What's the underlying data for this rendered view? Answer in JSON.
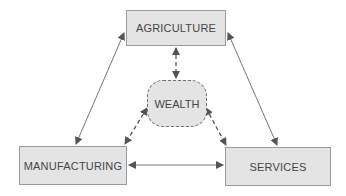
{
  "diagram": {
    "nodes": {
      "agriculture": {
        "label": "AGRICULTURE"
      },
      "manufacturing": {
        "label": "MANUFACTURING"
      },
      "services": {
        "label": "SERVICES"
      },
      "wealth": {
        "label": "WEALTH"
      }
    },
    "edges": [
      {
        "from": "agriculture",
        "to": "manufacturing",
        "style": "solid",
        "direction": "both"
      },
      {
        "from": "agriculture",
        "to": "services",
        "style": "solid",
        "direction": "both"
      },
      {
        "from": "manufacturing",
        "to": "services",
        "style": "solid",
        "direction": "both"
      },
      {
        "from": "agriculture",
        "to": "wealth",
        "style": "dashed",
        "direction": "both"
      },
      {
        "from": "manufacturing",
        "to": "wealth",
        "style": "dashed",
        "direction": "both"
      },
      {
        "from": "services",
        "to": "wealth",
        "style": "dashed",
        "direction": "both"
      }
    ],
    "colors": {
      "box_fill": "#e4e4e4",
      "box_border": "#9a9a9a",
      "arrow": "#555555",
      "text": "#444444"
    }
  }
}
